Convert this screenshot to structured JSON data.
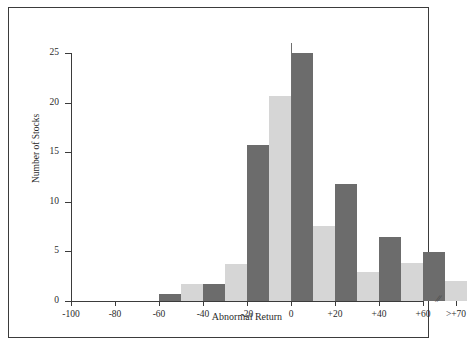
{
  "chart_data": {
    "type": "bar",
    "title": "",
    "subtitle": "",
    "xlabel": "Abnormal Return",
    "ylabel": "Number of Stocks",
    "ylim": [
      0,
      26
    ],
    "yticks": [
      0,
      5,
      10,
      15,
      20,
      25
    ],
    "ytick_labels": [
      "0",
      "5",
      "10",
      "15",
      "20",
      "25"
    ],
    "xtick_labels": [
      "-100",
      "-80",
      "-60",
      "-40",
      "-20",
      "0",
      "+20",
      "+40",
      "+60",
      ">+70"
    ],
    "xtick_values": [
      -100,
      -80,
      -60,
      -40,
      -20,
      0,
      20,
      40,
      60,
      70
    ],
    "axis_break_label": "//",
    "grid": false,
    "legend": "none",
    "bin_width": 10,
    "categories": [
      "-100 to -90",
      "-90 to -80",
      "-80 to -70",
      "-70 to -60",
      "-60 to -50",
      "-50 to -40",
      "-40 to -30",
      "-30 to -20",
      "-20 to -10",
      "-10 to 0",
      "0 to +10",
      "+10 to +20",
      "+20 to +30",
      "+30 to +40",
      "+40 to +50",
      "+50 to +60",
      "+60 to +70",
      ">+70"
    ],
    "values": [
      0,
      0,
      0,
      0,
      0.7,
      1.7,
      1.7,
      3.7,
      15.7,
      20.7,
      25,
      7.6,
      11.8,
      2.9,
      6.5,
      3.8,
      4.9,
      2.0
    ],
    "bar_colors": [
      "#6c6c6c",
      "#d6d6d6",
      "#6c6c6c",
      "#d6d6d6",
      "#6c6c6c",
      "#d6d6d6",
      "#6c6c6c",
      "#d6d6d6",
      "#6c6c6c",
      "#d6d6d6",
      "#6c6c6c",
      "#d6d6d6",
      "#6c6c6c",
      "#d6d6d6",
      "#6c6c6c",
      "#d6d6d6",
      "#6c6c6c",
      "#d6d6d6"
    ],
    "colors": {
      "dark_bar": "#6c6c6c",
      "light_bar": "#d6d6d6",
      "axis": "#3b3b3b",
      "frame": "#3b3b3b",
      "background": "#ffffff",
      "text": "#2b2b2b"
    }
  }
}
